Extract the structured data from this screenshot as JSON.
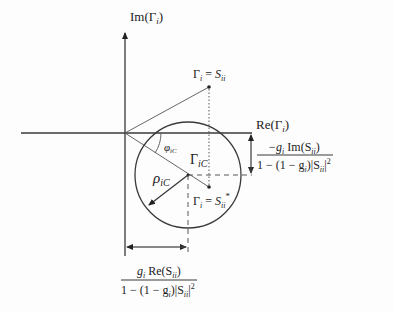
{
  "diagram": {
    "axes": {
      "vertical_label": {
        "base": "Im(Γ",
        "sub": "i",
        "tail": ")"
      },
      "horizontal_label": {
        "base": "Re(Γ",
        "sub": "i",
        "tail": ")"
      }
    },
    "points": {
      "sii": {
        "lhs": "Γ",
        "lhs_sub": "i",
        "eq": " = ",
        "rhs": "S",
        "rhs_sub": "ii"
      },
      "sii_conj": {
        "lhs": "Γ",
        "lhs_sub": "i",
        "eq": " = ",
        "rhs": "S",
        "rhs_sub": "ii",
        "sup": "*"
      }
    },
    "circle": {
      "center_label": {
        "base": "Γ",
        "sub": "iC"
      },
      "radius_label": {
        "base": "ρ",
        "sub": "iC"
      },
      "angle_label": {
        "base": "φ",
        "sub": "iC"
      }
    },
    "dimensions": {
      "vertical_offset": {
        "numerator": {
          "a": "−g",
          "a_sub": "i",
          "b": " Im(S",
          "b_sub": "ii",
          "c": ")"
        },
        "denominator": {
          "a": "1 − (1 − g",
          "a_sub": "i",
          "b": ")|S",
          "b_sub": "ii",
          "c": "|",
          "sup": "2"
        }
      },
      "horizontal_offset": {
        "numerator": {
          "a": "g",
          "a_sub": "i",
          "b": " Re(S",
          "b_sub": "ii",
          "c": ")"
        },
        "denominator": {
          "a": "1 − (1 − g",
          "a_sub": "i",
          "b": ")|S",
          "b_sub": "ii",
          "c": "|",
          "sup": "2"
        }
      }
    }
  }
}
